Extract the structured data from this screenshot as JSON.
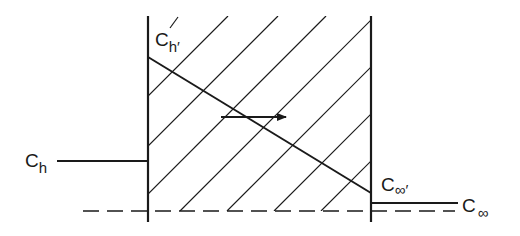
{
  "diagram": {
    "colors": {
      "line": "#1a1a1a",
      "background": "#ffffff"
    },
    "labels": {
      "ch": {
        "base": "C",
        "sub": "h"
      },
      "ch_prime": {
        "base": "C",
        "sub": "h′"
      },
      "cinf_prime": {
        "base": "C",
        "sub": "∞′"
      },
      "cinf": {
        "base": "C",
        "sub": "∞"
      }
    },
    "elements": {
      "left_wall": "left boundary",
      "right_wall": "right boundary",
      "hatched_region": "membrane layer",
      "profile_line": "linear concentration gradient",
      "flux_arrow": "direction of flux",
      "baseline": "dashed zero reference"
    }
  }
}
